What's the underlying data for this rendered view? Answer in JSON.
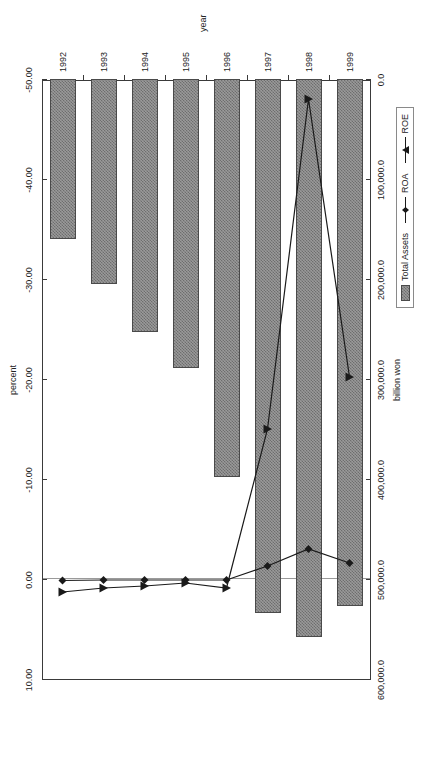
{
  "chart_data": {
    "type": "bar",
    "title": "",
    "orientation": "rotated-90-ccw",
    "categories": [
      "1992",
      "1993",
      "1994",
      "1995",
      "1996",
      "1997",
      "1998",
      "1999"
    ],
    "xlabel": "year",
    "primary_axis": {
      "label": "billion won",
      "ticks": [
        "600,000.0",
        "500,000.0",
        "400,000.0",
        "300,000.0",
        "200,000.0",
        "100,000.0",
        "0.0"
      ],
      "tick_values": [
        600000,
        500000,
        400000,
        300000,
        200000,
        100000,
        0
      ],
      "range": [
        0,
        600000
      ]
    },
    "secondary_axis": {
      "label": "percent",
      "ticks": [
        "10.00",
        "0.00",
        "-10.00",
        "-20.00",
        "-30.00",
        "-40.00",
        "-50.00"
      ],
      "tick_values": [
        10,
        0,
        -10,
        -20,
        -30,
        -40,
        -50
      ],
      "range": [
        -50,
        10
      ]
    },
    "series": [
      {
        "name": "Total Assets",
        "kind": "bar",
        "axis": "billion won",
        "values": [
          160000,
          205000,
          253000,
          289000,
          398000,
          534000,
          558000,
          527000
        ]
      },
      {
        "name": "ROA",
        "kind": "line",
        "marker": "diamond",
        "axis": "percent",
        "values": [
          0.15,
          0.1,
          0.1,
          0.1,
          0.1,
          -1.3,
          -3.0,
          -1.6
        ]
      },
      {
        "name": "ROE",
        "kind": "line",
        "marker": "triangle",
        "axis": "percent",
        "values": [
          1.3,
          0.9,
          0.7,
          0.4,
          0.9,
          -15.0,
          -48.0,
          -20.2
        ]
      }
    ],
    "legend": {
      "position": "bottom-right",
      "entries": [
        "Total Assets",
        "ROA",
        "ROE"
      ]
    },
    "grid": false,
    "colors": {
      "bar_fill": "#9a9a9a",
      "bar_pattern": "#6e6e6e",
      "bar_border": "#4a4a4a",
      "line": "#1a1a1a",
      "axis": "#3a3a3a",
      "zero_line": "#9a9a9a",
      "background": "#ffffff"
    }
  }
}
